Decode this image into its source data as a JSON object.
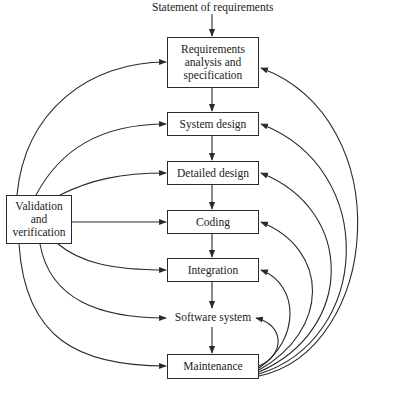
{
  "diagram": {
    "input_label": "Statement of requirements",
    "stages": [
      {
        "id": "requirements",
        "label": "Requirements analysis and specification",
        "lines": [
          "Requirements",
          "analysis and",
          "specification"
        ]
      },
      {
        "id": "system-design",
        "label": "System design"
      },
      {
        "id": "detailed-design",
        "label": "Detailed design"
      },
      {
        "id": "coding",
        "label": "Coding"
      },
      {
        "id": "integration",
        "label": "Integration"
      },
      {
        "id": "software-system",
        "label": "Software system"
      },
      {
        "id": "maintenance",
        "label": "Maintenance"
      }
    ],
    "vv": {
      "label": "Validation and verification",
      "lines": [
        "Validation",
        "and",
        "verification"
      ]
    },
    "edges": {
      "main_flow": [
        "Statement of requirements -> Requirements analysis and specification",
        "Requirements analysis and specification -> System design",
        "System design -> Detailed design",
        "Detailed design -> Coding",
        "Coding -> Integration",
        "Integration -> Software system",
        "Software system -> Maintenance"
      ],
      "vv_to": [
        "Requirements analysis and specification",
        "System design",
        "Detailed design",
        "Coding",
        "Integration",
        "Software system",
        "Maintenance"
      ],
      "maintenance_feedback_to": [
        "Requirements analysis and specification",
        "System design",
        "Detailed design",
        "Coding",
        "Integration",
        "Software system"
      ]
    },
    "colors": {
      "line": "#2a2a2a",
      "background": "#ffffff"
    }
  }
}
